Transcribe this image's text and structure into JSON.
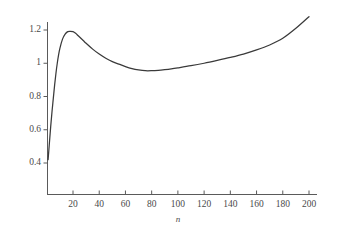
{
  "chart_data": {
    "type": "line",
    "title": "",
    "subtitle": "",
    "xlabel": "n",
    "ylabel": "",
    "xlim": [
      0,
      205
    ],
    "ylim": [
      0.28,
      1.33
    ],
    "grid": false,
    "legend": false,
    "legend_position": "none",
    "line_color": "#3a3a3a",
    "axis_color": "#5a5a5a",
    "background_color": "#ffffff",
    "xticks": [
      20,
      40,
      60,
      80,
      100,
      120,
      140,
      160,
      180,
      200
    ],
    "xtick_labels": [
      "20",
      "40",
      "60",
      "80",
      "100",
      "120",
      "140",
      "160",
      "180",
      "200"
    ],
    "yticks": [
      0.4,
      0.6,
      0.8,
      1.0,
      1.2
    ],
    "ytick_labels": [
      "0.4",
      "0.6",
      "0.8",
      "1",
      "1.2"
    ],
    "annotations": [],
    "series": [
      {
        "name": "curve",
        "x": [
          1,
          2,
          3,
          4,
          5,
          6,
          7,
          8,
          9,
          10,
          12,
          14,
          16,
          18,
          20,
          22,
          24,
          26,
          28,
          30,
          35,
          40,
          45,
          50,
          55,
          60,
          65,
          70,
          75,
          80,
          85,
          90,
          95,
          100,
          110,
          120,
          130,
          140,
          150,
          160,
          170,
          180,
          190,
          200
        ],
        "y": [
          0.42,
          0.52,
          0.62,
          0.71,
          0.79,
          0.87,
          0.94,
          1.0,
          1.05,
          1.09,
          1.145,
          1.175,
          1.19,
          1.192,
          1.19,
          1.18,
          1.165,
          1.15,
          1.135,
          1.12,
          1.085,
          1.055,
          1.03,
          1.01,
          0.995,
          0.98,
          0.968,
          0.96,
          0.955,
          0.955,
          0.957,
          0.961,
          0.966,
          0.972,
          0.985,
          1.0,
          1.017,
          1.035,
          1.055,
          1.08,
          1.11,
          1.15,
          1.21,
          1.28
        ]
      }
    ],
    "features": {
      "start_value": 0.42,
      "local_maximum": {
        "n": 19,
        "value": 1.19
      },
      "local_minimum": {
        "n": 77,
        "value": 0.955
      },
      "end_value": 1.28
    }
  },
  "axes": {
    "x_axis_title": "n"
  }
}
